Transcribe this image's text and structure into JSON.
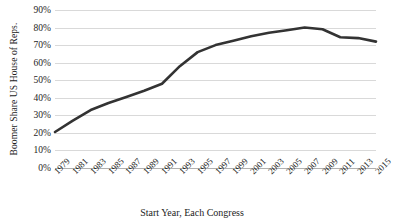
{
  "chart_data": {
    "type": "line",
    "title": "",
    "xlabel": "Start Year, Each Congress",
    "ylabel": "Boomer Share US House of Reps.",
    "categories": [
      "1979",
      "1981",
      "1983",
      "1985",
      "1987",
      "1989",
      "1991",
      "1993",
      "1995",
      "1997",
      "1999",
      "2001",
      "2003",
      "2005",
      "2007",
      "2009",
      "2011",
      "2013",
      "2015"
    ],
    "values": [
      20.5,
      27.0,
      33.0,
      37.0,
      40.5,
      44.0,
      48.0,
      58.0,
      66.0,
      70.0,
      72.5,
      75.0,
      77.0,
      78.5,
      80.0,
      79.0,
      74.5,
      74.0,
      72.0
    ],
    "series": [
      {
        "name": "Boomer Share US House of Reps.",
        "values": [
          20.5,
          27.0,
          33.0,
          37.0,
          40.5,
          44.0,
          48.0,
          58.0,
          66.0,
          70.0,
          72.5,
          75.0,
          77.0,
          78.5,
          80.0,
          79.0,
          74.5,
          74.0,
          72.0
        ],
        "color": "#333333"
      }
    ],
    "ylim": [
      0,
      90
    ],
    "ytick_values": [
      0,
      10,
      20,
      30,
      40,
      50,
      60,
      70,
      80,
      90
    ],
    "ytick_labels": [
      "0%",
      "10%",
      "20%",
      "30%",
      "40%",
      "50%",
      "60%",
      "70%",
      "80%",
      "90%"
    ],
    "grid": true,
    "grid_axis": "y",
    "legend": false,
    "legend_position": "none",
    "line_width_px": 2.6,
    "grid_color": "#d9d9d9",
    "axis_color": "#b0b0b0",
    "text_color": "#1d1d1d",
    "background": "#ffffff",
    "xtick_rotation_deg": -45
  }
}
